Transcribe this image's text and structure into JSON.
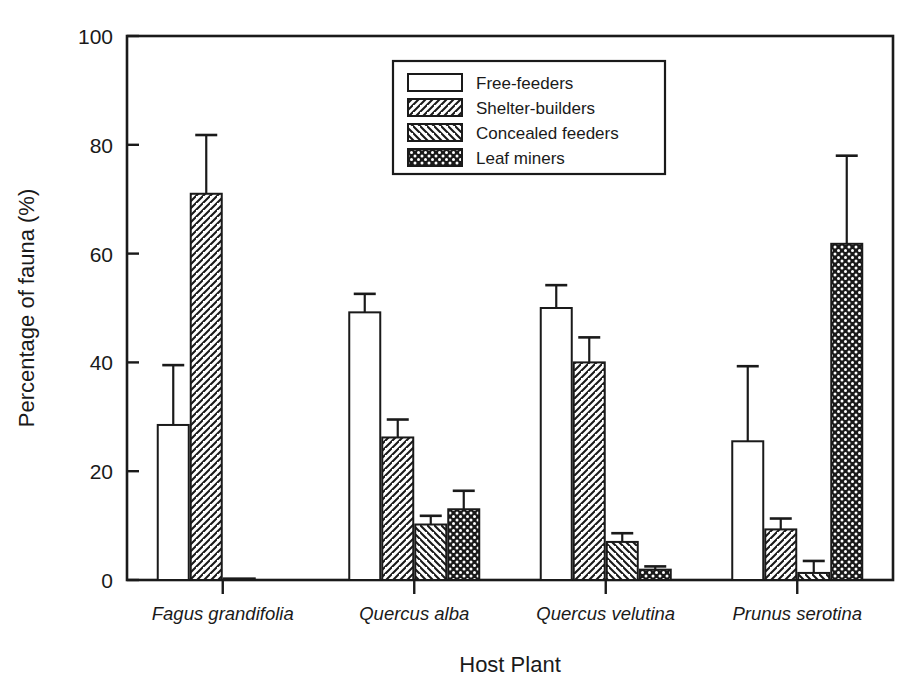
{
  "chart_data": {
    "type": "bar",
    "title": "",
    "xlabel": "Host Plant",
    "ylabel": "Percentage of fauna (%)",
    "ylim": [
      0,
      100
    ],
    "yticks": [
      0,
      20,
      40,
      60,
      80,
      100
    ],
    "ytick_labels": [
      "0",
      "20",
      "40",
      "60",
      "80",
      "100"
    ],
    "grid": false,
    "legend_position": "top-center-right",
    "categories": [
      "Fagus grandifolia",
      "Quercus alba",
      "Quercus velutina",
      "Prunus serotina"
    ],
    "series": [
      {
        "name": "Free-feeders",
        "pattern": "empty",
        "values": [
          28.5,
          49.2,
          50.0,
          25.5
        ],
        "errors": [
          11.0,
          3.4,
          4.2,
          13.8
        ]
      },
      {
        "name": "Shelter-builders",
        "pattern": "forward-hatch",
        "values": [
          71.0,
          26.2,
          40.0,
          9.3
        ],
        "errors": [
          10.8,
          3.3,
          4.6,
          2.0
        ]
      },
      {
        "name": "Concealed feeders",
        "pattern": "back-hatch",
        "values": [
          0.3,
          10.2,
          7.0,
          1.3
        ],
        "errors": [
          0.0,
          1.6,
          1.6,
          2.2
        ]
      },
      {
        "name": "Leaf miners",
        "pattern": "crosshatch",
        "values": [
          0.0,
          13.0,
          1.9,
          61.8
        ],
        "errors": [
          0.0,
          3.4,
          0.6,
          16.2
        ]
      }
    ]
  },
  "legend": {
    "items": [
      {
        "label": "Free-feeders",
        "pattern": "empty"
      },
      {
        "label": "Shelter-builders",
        "pattern": "forward-hatch"
      },
      {
        "label": "Concealed feeders",
        "pattern": "back-hatch"
      },
      {
        "label": "Leaf miners",
        "pattern": "crosshatch"
      }
    ]
  },
  "colors": {
    "ink": "#1a1a1a",
    "background": "#ffffff",
    "bar_fill": "#ffffff"
  }
}
